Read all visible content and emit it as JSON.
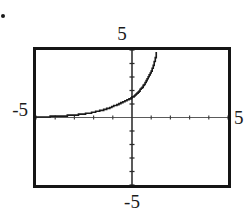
{
  "image": {
    "width": 248,
    "height": 218,
    "background_color": "#ffffff",
    "ink_color": "#151515"
  },
  "artifacts": {
    "corner_speck_label": "·"
  },
  "graph": {
    "frame": {
      "border_color": "#151515",
      "background_color": "#ffffff"
    },
    "axis_color": "#4a4a4a",
    "curve_color": "#1a1a1a",
    "labels": {
      "top": "5",
      "bottom": "-5",
      "left": "-5",
      "right": "5"
    }
  },
  "chart_data": {
    "type": "line",
    "title": "",
    "xlabel": "",
    "ylabel": "",
    "xlim": [
      -5,
      5
    ],
    "ylim": [
      -5,
      5
    ],
    "xtick_labels": [
      "-5",
      "5"
    ],
    "ytick_labels": [
      "-5",
      "5"
    ],
    "tick_interval": 1,
    "grid": false,
    "legend": null,
    "axes_drawn": true,
    "curve_description": "increasing exponential growth curve, asymptotic to the x-axis for negative x, crossing the y-axis near y = 1.5 and leaving the top of the window near x = 1.3",
    "series": [
      {
        "name": "exponential curve",
        "x": [
          -5.0,
          -4.5,
          -4.0,
          -3.5,
          -3.0,
          -2.5,
          -2.0,
          -1.5,
          -1.0,
          -0.5,
          0.0,
          0.25,
          0.5,
          0.75,
          1.0,
          1.15,
          1.3
        ],
        "y": [
          0.04,
          0.06,
          0.09,
          0.13,
          0.19,
          0.27,
          0.4,
          0.57,
          0.83,
          1.13,
          1.5,
          1.8,
          2.2,
          2.75,
          3.45,
          4.1,
          5.0
        ]
      }
    ],
    "asymptote": {
      "type": "horizontal",
      "value": 0
    }
  }
}
